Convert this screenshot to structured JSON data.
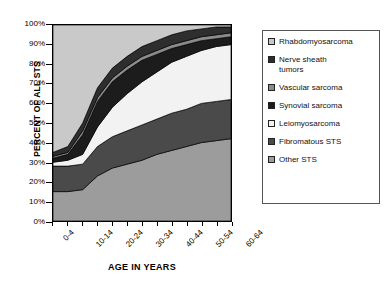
{
  "chart": {
    "ylabel": "PERCENT OF ALL STS",
    "xlabel": "AGE IN YEARS",
    "yticks": [
      "100%",
      "90%",
      "80%",
      "70%",
      "60%",
      "50%",
      "40%",
      "30%",
      "20%",
      "10%",
      "0%"
    ],
    "xticks": [
      "0-4",
      "10-14",
      "20-24",
      "30-34",
      "40-44",
      "50-54",
      "60-64"
    ]
  },
  "legend": {
    "items": [
      {
        "label": "Rhabdomyosarcoma",
        "color": "#c9c9c9"
      },
      {
        "label": "Nerve sheath\ntumors",
        "color": "#2e2e2e"
      },
      {
        "label": "Vascular sarcoma",
        "color": "#8a8a8a"
      },
      {
        "label": "Synovial sarcoma",
        "color": "#1c1c1c"
      },
      {
        "label": "Leiomyosarcoma",
        "color": "#f2f2f2"
      },
      {
        "label": "Fibromatous STS",
        "color": "#4a4a4a"
      },
      {
        "label": "Other STS",
        "color": "#9c9c9c"
      }
    ]
  },
  "chart_data": {
    "type": "area",
    "stacked": true,
    "title": "",
    "xlabel": "AGE IN YEARS",
    "ylabel": "PERCENT OF ALL STS",
    "ylim": [
      0,
      100
    ],
    "grid": false,
    "legend_position": "right",
    "categories": [
      "0-4",
      "5-9",
      "10-14",
      "15-19",
      "20-24",
      "25-29",
      "30-34",
      "35-39",
      "40-44",
      "45-49",
      "50-54",
      "55-59",
      "60-64"
    ],
    "series": [
      {
        "name": "Other STS",
        "color": "#9c9c9c",
        "values": [
          15,
          15,
          16,
          23,
          27,
          29,
          31,
          34,
          36,
          38,
          40,
          41,
          42
        ]
      },
      {
        "name": "Fibromatous STS",
        "color": "#4a4a4a",
        "values": [
          13,
          13,
          13,
          15,
          16,
          17,
          18,
          18,
          19,
          19,
          20,
          20,
          20
        ]
      },
      {
        "name": "Leiomyosarcoma",
        "color": "#f2f2f2",
        "values": [
          2,
          3,
          5,
          10,
          15,
          19,
          22,
          24,
          26,
          27,
          27,
          28,
          28
        ]
      },
      {
        "name": "Synovial sarcoma",
        "color": "#1c1c1c",
        "values": [
          2,
          3,
          10,
          13,
          13,
          12,
          11,
          9,
          7,
          6,
          5,
          4,
          4
        ]
      },
      {
        "name": "Vascular sarcoma",
        "color": "#8a8a8a",
        "values": [
          1,
          1,
          2,
          2,
          2,
          2,
          2,
          2,
          2,
          2,
          2,
          2,
          2
        ]
      },
      {
        "name": "Nerve sheath tumors",
        "color": "#2e2e2e",
        "values": [
          2,
          3,
          4,
          5,
          5,
          5,
          5,
          5,
          5,
          5,
          4,
          4,
          3
        ]
      },
      {
        "name": "Rhabdomyosarcoma",
        "color": "#c9c9c9",
        "values": [
          65,
          62,
          50,
          32,
          22,
          16,
          11,
          8,
          5,
          3,
          2,
          1,
          1
        ]
      }
    ]
  }
}
